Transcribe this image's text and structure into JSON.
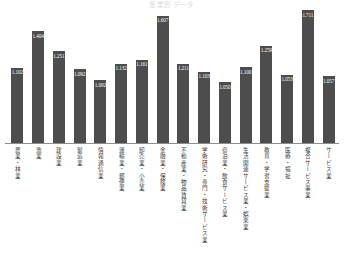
{
  "chart_title": "産業別 データ",
  "chart_subtitle": "",
  "axis": {
    "baseline_visible": true,
    "grid": false
  },
  "chart_data": {
    "type": "bar",
    "title": "産業別 データ",
    "xlabel": "",
    "ylabel": "",
    "ylim": [
      0,
      1.8
    ],
    "grid": false,
    "legend": "none",
    "orientation": "vertical",
    "bar_color": "#4d4d4d",
    "value_label_position": "inside-top",
    "categories": [
      "農業・林業",
      "漁業",
      "建設業",
      "製造業",
      "情報通信業",
      "運輸業・郵便業",
      "卸売業・小売業",
      "金融業・保険業",
      "不動産業・物品賃貸業",
      "学術研究・専門・技術サービス業",
      "宿泊業・飲食サービス業",
      "生活関連サービス業・娯楽業",
      "教育・学習支援業",
      "医療・福祉",
      "複合サービス事業",
      "サービス業"
    ],
    "values": [
      1.102,
      1.404,
      1.251,
      1.092,
      1.132,
      1.161,
      1.607,
      1.211,
      1.103,
      1.05,
      1.1,
      1.259,
      1.053,
      1.711,
      1.057,
      1.057
    ],
    "value_labels": [
      "1.102",
      "1.404",
      "1.251",
      "1.092",
      "1.132",
      "1.161",
      "1.607",
      "1.211",
      "1.103",
      "1.050",
      "1.100",
      "1.259",
      "1.053",
      "1.711",
      "1.057",
      "1.057"
    ]
  },
  "bars": [
    {
      "label": "農業・林業",
      "value_label": "1.102",
      "height_pct": 56.0
    },
    {
      "label": "漁業",
      "value_label": "1.404",
      "height_pct": 83.5
    },
    {
      "label": "建設業",
      "value_label": "1.251",
      "height_pct": 68.5
    },
    {
      "label": "製造業",
      "value_label": "1.092",
      "height_pct": 55.0
    },
    {
      "label": "情報通信業",
      "value_label": "1.092",
      "height_pct": 47.0
    },
    {
      "label": "運輸業・郵便業",
      "value_label": "1.132",
      "height_pct": 59.0
    },
    {
      "label": "卸売業・小売業",
      "value_label": "1.161",
      "height_pct": 62.0
    },
    {
      "label": "金融業・保険業",
      "value_label": "1.607",
      "height_pct": 95.0
    },
    {
      "label": "不動産業・物品賃貸業",
      "value_label": "1.211",
      "height_pct": 59.0
    },
    {
      "label": "学術研究・専門・技術サービス業",
      "value_label": "1.103",
      "height_pct": 53.0
    },
    {
      "label": "宿泊業・飲食サービス業",
      "value_label": "1.050",
      "height_pct": 45.5
    },
    {
      "label": "生活関連サービス業・娯楽業",
      "value_label": "1.100",
      "height_pct": 56.5
    },
    {
      "label": "教育・学習支援業",
      "value_label": "1.259",
      "height_pct": 72.5
    },
    {
      "label": "医療・福祉",
      "value_label": "1.053",
      "height_pct": 51.0
    },
    {
      "label": "複合サービス事業",
      "value_label": "1.711",
      "height_pct": 99.0
    },
    {
      "label": "サービス業",
      "value_label": "1.057",
      "height_pct": 50.0
    }
  ]
}
